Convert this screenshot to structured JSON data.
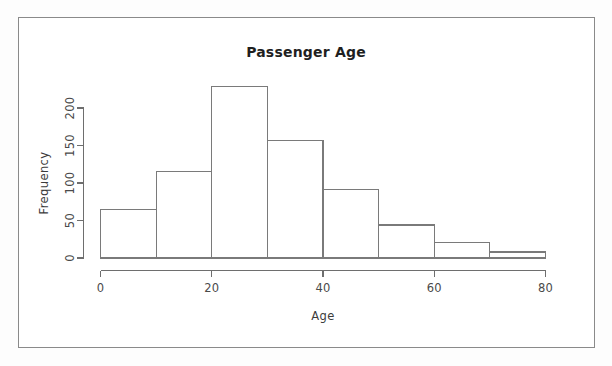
{
  "chart_data": {
    "type": "bar",
    "title": "Passenger Age",
    "subtitle": "",
    "xlabel": "Age",
    "ylabel": "Frequency",
    "categories": [
      "0-10",
      "10-20",
      "20-30",
      "30-40",
      "40-50",
      "50-60",
      "60-70",
      "70-80"
    ],
    "bin_edges": [
      0,
      10,
      20,
      30,
      40,
      50,
      60,
      70,
      80
    ],
    "values": [
      65,
      115,
      229,
      157,
      91,
      44,
      21,
      8
    ],
    "xlim": [
      0,
      80
    ],
    "ylim": [
      0,
      230
    ],
    "x_ticks": [
      0,
      20,
      40,
      60,
      80
    ],
    "x_tick_labels": [
      "0",
      "20",
      "40",
      "60",
      "80"
    ],
    "y_ticks": [
      0,
      50,
      100,
      150,
      200
    ],
    "y_tick_labels": [
      "0",
      "50",
      "100",
      "150",
      "200"
    ],
    "grid": false,
    "legend": false,
    "legend_position": "none",
    "bar_fill": "#ffffff",
    "bar_stroke": "#7a7a7a",
    "axis_color": "#6e6e6e",
    "background": "#ffffff",
    "frame_color": "#8a8a8a",
    "y_tick_label_rotation": -90
  },
  "figure": {
    "border_label": "plot-border",
    "canvas_background": "#fdfdfd"
  }
}
